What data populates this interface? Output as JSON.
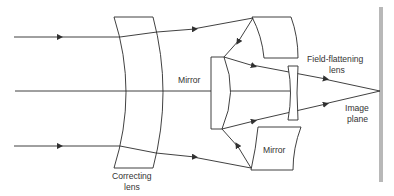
{
  "diagram": {
    "type": "optical-schematic",
    "labels": {
      "mirror_primary": "Mirror",
      "mirror_secondary": "Mirror",
      "field_lens_line1": "Field-flattening",
      "field_lens_line2": "lens",
      "image_plane_line1": "Image",
      "image_plane_line2": "plane",
      "correcting_lens_line1": "Correcting",
      "correcting_lens_line2": "lens"
    },
    "components": [
      "correcting-lens",
      "central-mirror",
      "upper-mirror",
      "lower-mirror",
      "field-flattening-lens",
      "image-plane",
      "optical-axis"
    ],
    "colors": {
      "stroke": "#2b2b2b",
      "image_plane": "#b8b8b8",
      "text": "#333333"
    }
  }
}
